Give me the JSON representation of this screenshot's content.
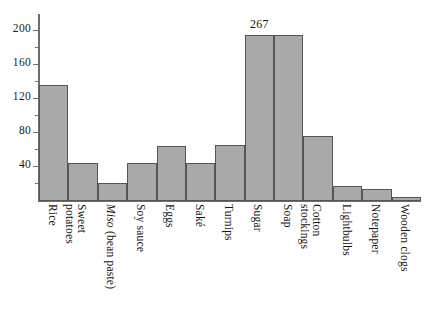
{
  "chart_data": {
    "type": "bar",
    "title": "",
    "subtitle": "",
    "xlabel": "",
    "ylabel": "",
    "categories": [
      "Rice",
      "Sweet potatoes",
      "Miso (bean paste)",
      "Soy sauce",
      "Eggs",
      "Saké",
      "Turnips",
      "Sugar",
      "Soap",
      "Cotton stockings",
      "Lightbulbs",
      "Notepaper",
      "Wooden clogs"
    ],
    "values": [
      137,
      45,
      21,
      45,
      65,
      45,
      66,
      267,
      202,
      77,
      18,
      14,
      5
    ],
    "ylim": [
      0,
      230
    ],
    "y_ticks_major": [
      40,
      80,
      120,
      160,
      200
    ],
    "y_ticks_minor": [
      20,
      60,
      100,
      140,
      180,
      220
    ],
    "y_tick_labels": [
      "40",
      "80",
      "120",
      "160",
      "200"
    ],
    "grid": false,
    "legend": null,
    "bar_color": "#a9a9a9",
    "bar_edge_color": "#555555",
    "axis_color": "#6e6e6e",
    "text_color": "#141414",
    "background_color": "#ffffff",
    "annotations": [
      {
        "category": "Sugar",
        "text": "267",
        "note": "bar clipped at top of axis, value printed above bar"
      }
    ],
    "bars": [
      {
        "label": "Rice",
        "label_line1": "Rice",
        "label_line2": "",
        "italic_part": "",
        "value": 137,
        "value_label": "",
        "clipped": false
      },
      {
        "label": "Sweet potatoes",
        "label_line1": "Sweet",
        "label_line2": "potatoes",
        "italic_part": "",
        "value": 45,
        "value_label": "",
        "clipped": false
      },
      {
        "label": "Miso (bean paste)",
        "label_line1": "Miso",
        "label_line2": " (bean paste)",
        "italic_part": "Miso",
        "value": 21,
        "value_label": "",
        "clipped": false
      },
      {
        "label": "Soy sauce",
        "label_line1": "Soy sauce",
        "label_line2": "",
        "italic_part": "",
        "value": 45,
        "value_label": "",
        "clipped": false
      },
      {
        "label": "Eggs",
        "label_line1": "Eggs",
        "label_line2": "",
        "italic_part": "",
        "value": 65,
        "value_label": "",
        "clipped": false
      },
      {
        "label": "Saké",
        "label_line1": "Saké",
        "label_line2": "",
        "italic_part": "",
        "value": 45,
        "value_label": "",
        "clipped": false
      },
      {
        "label": "Turnips",
        "label_line1": "Turnips",
        "label_line2": "",
        "italic_part": "",
        "value": 66,
        "value_label": "",
        "clipped": false
      },
      {
        "label": "Sugar",
        "label_line1": "Sugar",
        "label_line2": "",
        "italic_part": "",
        "value": 267,
        "value_label": "267",
        "clipped": true
      },
      {
        "label": "Soap",
        "label_line1": "Soap",
        "label_line2": "",
        "italic_part": "",
        "value": 202,
        "value_label": "",
        "clipped": false
      },
      {
        "label": "Cotton stockings",
        "label_line1": "Cotton",
        "label_line2": "stockings",
        "italic_part": "",
        "value": 77,
        "value_label": "",
        "clipped": false
      },
      {
        "label": "Lightbulbs",
        "label_line1": "Lightbulbs",
        "label_line2": "",
        "italic_part": "",
        "value": 18,
        "value_label": "",
        "clipped": false
      },
      {
        "label": "Notepaper",
        "label_line1": "Notepaper",
        "label_line2": "",
        "italic_part": "",
        "value": 14,
        "value_label": "",
        "clipped": false
      },
      {
        "label": "Wooden clogs",
        "label_line1": "Wooden clogs",
        "label_line2": "",
        "italic_part": "",
        "value": 5,
        "value_label": "",
        "clipped": false
      }
    ]
  }
}
